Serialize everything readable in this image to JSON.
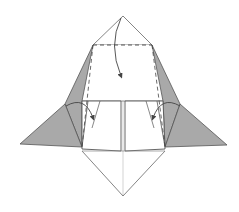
{
  "diagram": {
    "type": "origami-fold-step",
    "colors": {
      "paper_front": "#ffffff",
      "paper_back": "#a8a8a8",
      "line": "#555555",
      "crease": "#bbbbbb"
    },
    "annotations": [
      {
        "kind": "valley-fold-line",
        "position": "top horizontal dashed"
      },
      {
        "kind": "fold-arrow",
        "direction": "down",
        "position": "top flap"
      },
      {
        "kind": "fold-arrow",
        "direction": "in",
        "position": "left flap"
      },
      {
        "kind": "fold-arrow",
        "direction": "in",
        "position": "right flap"
      },
      {
        "kind": "valley-fold-line",
        "position": "left diagonal dashed"
      },
      {
        "kind": "valley-fold-line",
        "position": "right diagonal dashed"
      }
    ]
  }
}
